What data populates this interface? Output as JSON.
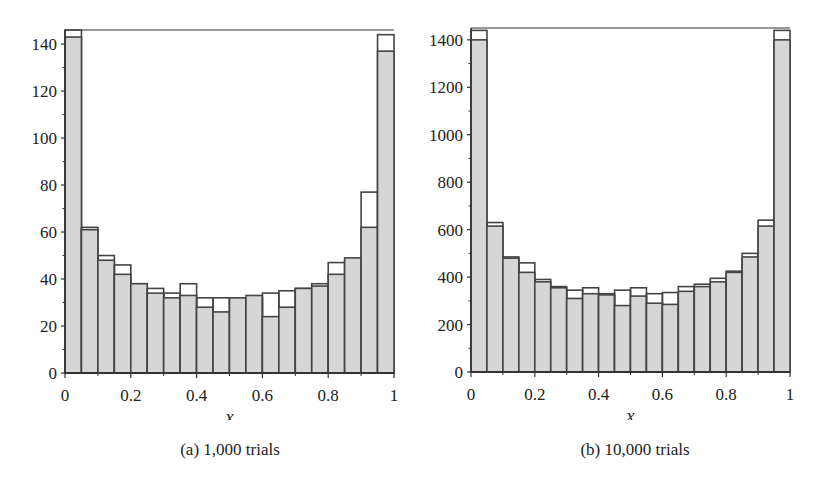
{
  "colors": {
    "bar_fill": "#d6d6d6",
    "bar_stroke": "#444444",
    "axis": "#333333",
    "background": "#ffffff"
  },
  "chart_data": [
    {
      "type": "bar",
      "title": "",
      "caption": "(a) 1,000 trials",
      "xlabel": "x",
      "ylabel": "",
      "xlim": [
        0,
        1
      ],
      "ylim": [
        0,
        146
      ],
      "x_ticks": [
        "0",
        "0.2",
        "0.4",
        "0.6",
        "0.8",
        "1"
      ],
      "y_ticks": [
        "0",
        "20",
        "40",
        "60",
        "80",
        "100",
        "120",
        "140"
      ],
      "bin_width": 0.05,
      "grid": false,
      "legend": null,
      "categories": [
        "0-0.05",
        "0.05-0.1",
        "0.1-0.15",
        "0.15-0.2",
        "0.2-0.25",
        "0.25-0.3",
        "0.3-0.35",
        "0.35-0.4",
        "0.4-0.45",
        "0.45-0.5",
        "0.5-0.55",
        "0.55-0.6",
        "0.6-0.65",
        "0.65-0.7",
        "0.7-0.75",
        "0.75-0.8",
        "0.8-0.85",
        "0.85-0.9",
        "0.9-0.95",
        "0.95-1"
      ],
      "series": [
        {
          "name": "observed",
          "style": "filled",
          "values": [
            143,
            61,
            48,
            42,
            38,
            34,
            32,
            33,
            28,
            26,
            32,
            33,
            24,
            28,
            36,
            37,
            42,
            49,
            62,
            137
          ]
        },
        {
          "name": "outline",
          "style": "outline",
          "values": [
            146,
            62,
            50,
            46,
            38,
            36,
            34,
            38,
            32,
            32,
            32,
            32,
            34,
            35,
            36,
            38,
            47,
            48,
            77,
            144
          ]
        }
      ]
    },
    {
      "type": "bar",
      "title": "",
      "caption": "(b) 10,000 trials",
      "xlabel": "x",
      "ylabel": "",
      "xlim": [
        0,
        1
      ],
      "ylim": [
        0,
        1450
      ],
      "x_ticks": [
        "0",
        "0.2",
        "0.4",
        "0.6",
        "0.8",
        "1"
      ],
      "y_ticks": [
        "0",
        "200",
        "400",
        "600",
        "800",
        "1000",
        "1200",
        "1400"
      ],
      "bin_width": 0.05,
      "grid": false,
      "legend": null,
      "categories": [
        "0-0.05",
        "0.05-0.1",
        "0.1-0.15",
        "0.15-0.2",
        "0.2-0.25",
        "0.25-0.3",
        "0.3-0.35",
        "0.35-0.4",
        "0.4-0.45",
        "0.45-0.5",
        "0.5-0.55",
        "0.55-0.6",
        "0.6-0.65",
        "0.65-0.7",
        "0.7-0.75",
        "0.75-0.8",
        "0.8-0.85",
        "0.85-0.9",
        "0.9-0.95",
        "0.95-1"
      ],
      "series": [
        {
          "name": "observed",
          "style": "filled",
          "values": [
            1400,
            615,
            480,
            420,
            380,
            355,
            310,
            330,
            325,
            280,
            320,
            290,
            285,
            340,
            360,
            380,
            420,
            485,
            615,
            1400
          ]
        },
        {
          "name": "outline",
          "style": "outline",
          "values": [
            1440,
            630,
            485,
            460,
            390,
            360,
            345,
            355,
            330,
            345,
            355,
            330,
            335,
            360,
            370,
            395,
            425,
            500,
            640,
            1440
          ]
        }
      ]
    }
  ]
}
